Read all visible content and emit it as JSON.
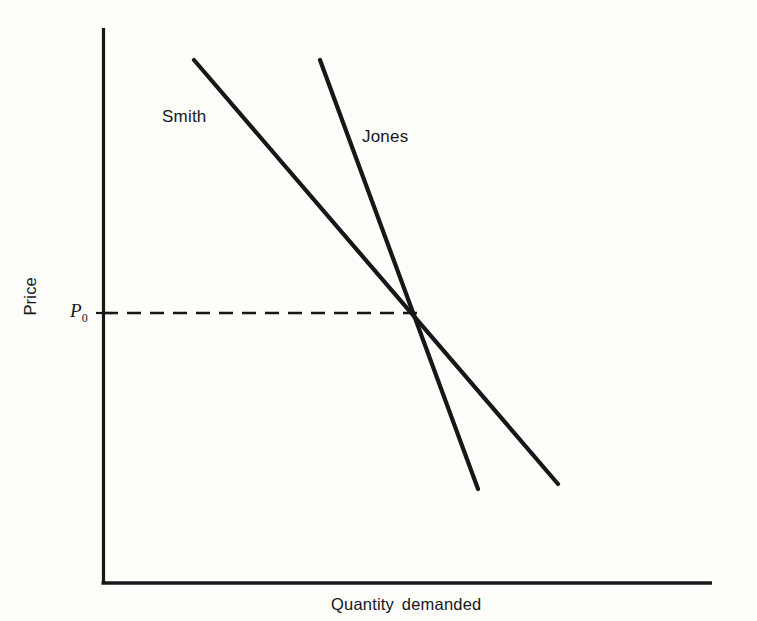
{
  "figure": {
    "background_color": "#fdfdfa",
    "ink_color": "#17171a"
  },
  "labels": {
    "smith": "Smith",
    "jones": "Jones",
    "price_axis": "Price",
    "quantity_axis": "Quantity demanded",
    "equilibrium_price": "P",
    "equilibrium_price_sub": "0"
  },
  "chart_data": {
    "type": "line",
    "title": "",
    "xlabel": "Quantity demanded",
    "ylabel": "Price",
    "grid": false,
    "legend": "inline-annotations",
    "axes": {
      "x_axis_line": {
        "x1": 103,
        "y1": 583,
        "x2": 712,
        "y2": 583
      },
      "y_axis_line": {
        "x1": 103,
        "y1": 28,
        "x2": 103,
        "y2": 583
      },
      "ticks_x": [],
      "ticks_y": [
        {
          "label": "P0",
          "pixel_y": 313
        }
      ],
      "xlim_note": "unlabeled quantity axis, increasing to the right",
      "ylim_note": "unlabeled price axis, increasing upward"
    },
    "series": [
      {
        "name": "Smith",
        "description": "flatter (more elastic) individual demand curve",
        "points": [
          {
            "x": 194,
            "y": 60
          },
          {
            "x": 558,
            "y": 484
          }
        ],
        "slope_relative": "shallow",
        "label_position": {
          "x": 162,
          "y": 107
        }
      },
      {
        "name": "Jones",
        "description": "steeper (less elastic) individual demand curve",
        "points": [
          {
            "x": 320,
            "y": 60
          },
          {
            "x": 478,
            "y": 489
          }
        ],
        "slope_relative": "steep",
        "label_position": {
          "x": 362,
          "y": 127
        }
      }
    ],
    "annotations": [
      {
        "name": "equilibrium-price-guide",
        "type": "dashed-horizontal",
        "label": "P0",
        "from": {
          "x": 103,
          "y": 313
        },
        "to": {
          "x": 418,
          "y": 313
        }
      },
      {
        "name": "intersection-point",
        "type": "crossing",
        "x": 417,
        "y": 313,
        "meaning": "Smith and Jones demand curves cross at price P0"
      }
    ]
  }
}
